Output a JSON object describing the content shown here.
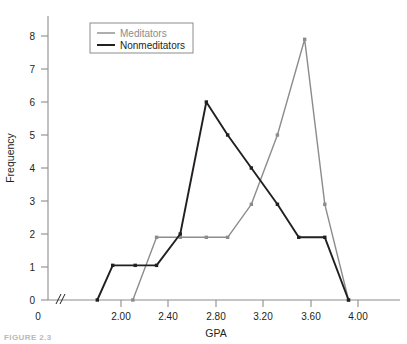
{
  "figure": {
    "caption": "FIGURE 2.3"
  },
  "chart_data": {
    "type": "line",
    "title": "",
    "xlabel": "GPA",
    "ylabel": "Frequency",
    "xlim": [
      1.72,
      4.06
    ],
    "ylim": [
      0,
      8.6
    ],
    "grid": false,
    "axis_break": true,
    "axis_break_symbol": "//",
    "legend_position": "top-left",
    "x_tick_labels": [
      "0",
      "2.00",
      "2.40",
      "2.80",
      "3.20",
      "3.60",
      "4.00"
    ],
    "x_tick_values": [
      null,
      2.0,
      2.4,
      2.8,
      3.2,
      3.6,
      4.0
    ],
    "y_tick_labels": [
      "0",
      "1",
      "2",
      "3",
      "4",
      "5",
      "6",
      "7",
      "8"
    ],
    "y_tick_values": [
      0,
      1,
      2,
      3,
      4,
      5,
      6,
      7,
      8
    ],
    "series": [
      {
        "name": "Meditators",
        "color": "#8c8c8c",
        "x": [
          2.1,
          2.3,
          2.5,
          2.72,
          2.9,
          3.1,
          3.32,
          3.55,
          3.72,
          3.92
        ],
        "values": [
          0,
          1.9,
          1.9,
          1.9,
          1.9,
          2.9,
          5.0,
          7.9,
          2.9,
          0
        ]
      },
      {
        "name": "Nonmeditators",
        "color": "#231f20",
        "x": [
          1.8,
          1.93,
          2.12,
          2.3,
          2.5,
          2.72,
          2.9,
          3.1,
          3.32,
          3.5,
          3.72,
          3.92
        ],
        "values": [
          0,
          1.05,
          1.05,
          1.05,
          2.0,
          6.0,
          5.0,
          4.0,
          2.9,
          1.9,
          1.9,
          0
        ]
      }
    ]
  },
  "legend": {
    "items": [
      {
        "label": "Meditators",
        "color": "#8c8c8c"
      },
      {
        "label": "Nonmeditators",
        "color": "#231f20"
      }
    ]
  }
}
